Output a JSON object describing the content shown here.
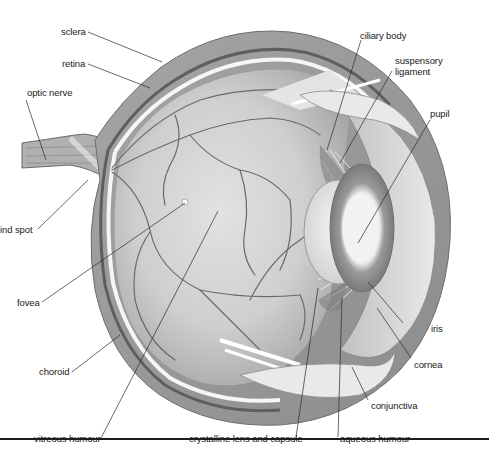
{
  "figure": {
    "colors": {
      "background": "#ffffff",
      "sclera": "#9a9a9a",
      "sclera_outer": "#b9b9b9",
      "choroid": "#6f6f6f",
      "retina_gap": "#f4f4f4",
      "vitreous": "#c8c8c8",
      "vitreous_light": "#dcdcdc",
      "vessel": "#6a6a6a",
      "lens": "#e6e6e6",
      "iris": "#8a8a8a",
      "cornea": "#d6d6d6",
      "label_text": "#1a1a1a",
      "leader_line": "#2a2a2a",
      "rule": "#1d1d1d"
    },
    "labels": {
      "sclera": "sclera",
      "retina": "retina",
      "optic_nerve": "optic nerve",
      "blind_spot": "ind spot",
      "fovea": "fovea",
      "choroid": "choroid",
      "vitreous_humour": "vitreous humour",
      "crystalline_lens": "crystalline lens and capsule",
      "aqueous_humour": "aqueous humour",
      "conjunctiva": "conjunctiva",
      "cornea": "cornea",
      "iris": "iris",
      "pupil": "pupil",
      "suspensory_ligament": "suspensory ligament",
      "ciliary_body": "ciliary body"
    }
  }
}
